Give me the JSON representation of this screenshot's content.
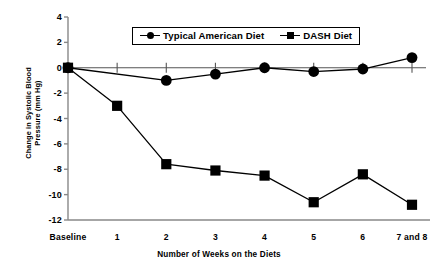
{
  "chart_data": {
    "type": "line",
    "title": "",
    "xlabel": "Number of Weeks on the Diets",
    "ylabel": "Change in Systolic Blood\nPressure (mm Hg)",
    "categories": [
      "Baseline",
      "1",
      "2",
      "3",
      "4",
      "5",
      "6",
      "7 and 8"
    ],
    "yticks": [
      "4",
      "2",
      "0",
      "-2",
      "-4",
      "-6",
      "-8",
      "-10",
      "-12"
    ],
    "ytick_values": [
      4,
      2,
      0,
      -2,
      -4,
      -6,
      -8,
      -10,
      -12
    ],
    "ylim": [
      -12,
      4
    ],
    "grid": false,
    "legend_position": "top-center",
    "series": [
      {
        "name": "Typical American Diet",
        "marker": "circle",
        "color": "#000000",
        "values": [
          0.0,
          null,
          -1.0,
          -0.5,
          0.0,
          -0.3,
          -0.1,
          0.8
        ]
      },
      {
        "name": "DASH Diet",
        "marker": "square",
        "color": "#000000",
        "values": [
          0.0,
          -3.0,
          -7.6,
          -8.1,
          -8.5,
          -10.6,
          -8.4,
          -10.8
        ]
      }
    ]
  },
  "axis": {
    "y_title": "Change in Systolic Blood\nPressure (mm Hg)",
    "x_title": "Number of Weeks on the Diets"
  },
  "legend": {
    "items": [
      {
        "label": "Typical American Diet",
        "marker": "circle-marker-icon"
      },
      {
        "label": "DASH Diet",
        "marker": "square-marker-icon"
      }
    ]
  }
}
